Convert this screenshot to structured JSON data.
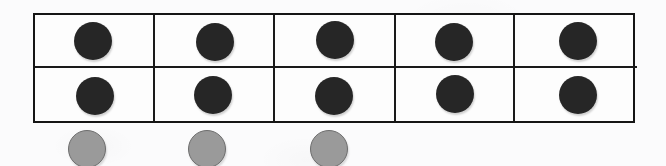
{
  "worksheet": {
    "title": "Ten frame with two-colour counters",
    "background_color": "#fbfbfc",
    "grid_line_color": "#1a1a1a"
  },
  "ten_frame": {
    "name": "ten-frame",
    "columns": 5,
    "rows": 2,
    "total_cells": 10,
    "cells_filled": 10,
    "cells_empty": 0,
    "row_labels": [
      "top-row",
      "bottom-row"
    ],
    "rows_data": [
      {
        "label": "top-row",
        "cells": [
          {
            "counter": "dark",
            "count": 1
          },
          {
            "counter": "dark",
            "count": 1
          },
          {
            "counter": "dark",
            "count": 1
          },
          {
            "counter": "dark",
            "count": 1
          },
          {
            "counter": "dark",
            "count": 1
          }
        ]
      },
      {
        "label": "bottom-row",
        "cells": [
          {
            "counter": "dark",
            "count": 1
          },
          {
            "counter": "dark",
            "count": 1
          },
          {
            "counter": "dark",
            "count": 1
          },
          {
            "counter": "dark",
            "count": 1
          },
          {
            "counter": "dark",
            "count": 1
          }
        ]
      }
    ]
  },
  "counters": {
    "dark": {
      "name": "dark-counter",
      "color": "#262626",
      "count_in_frame": 10,
      "diameter_px": 38
    },
    "gray": {
      "name": "gray-counter",
      "fill_color": "#9a9a9a",
      "stroke_color": "#6d6d6d",
      "count_outside_frame": 3,
      "diameter_px": 38,
      "positions_x_px": [
        68,
        188,
        310
      ]
    }
  },
  "loose_counters": [
    {
      "name": "gray-counter-1",
      "left": 68,
      "color": "#9a9a9a"
    },
    {
      "name": "gray-counter-2",
      "left": 188,
      "color": "#9a9a9a"
    },
    {
      "name": "gray-counter-3",
      "left": 310,
      "color": "#9a9a9a"
    }
  ]
}
